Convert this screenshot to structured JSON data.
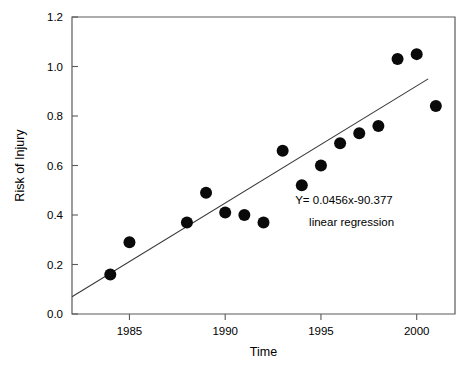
{
  "chart_data": {
    "type": "scatter",
    "title": "",
    "xlabel": "Time",
    "ylabel": "Risk of Injury",
    "xlim": [
      1982,
      2002
    ],
    "ylim": [
      0.0,
      1.2
    ],
    "grid": false,
    "legend": null,
    "x_ticks": [
      1985,
      1990,
      1995,
      2000
    ],
    "x_tick_labels": [
      "1985",
      "1990",
      "1995",
      "2000"
    ],
    "y_ticks": [
      0.0,
      0.2,
      0.4,
      0.6,
      0.8,
      1.0,
      1.2
    ],
    "y_tick_labels": [
      "0.0",
      "0.2",
      "0.4",
      "0.6",
      "0.8",
      "1.0",
      "1.2"
    ],
    "x": [
      1984,
      1985,
      1988,
      1989,
      1990,
      1991,
      1992,
      1993,
      1994,
      1995,
      1996,
      1997,
      1998,
      1999,
      2000,
      2001
    ],
    "y": [
      0.16,
      0.29,
      0.37,
      0.49,
      0.41,
      0.4,
      0.37,
      0.66,
      0.52,
      0.6,
      0.69,
      0.73,
      0.76,
      1.03,
      1.05,
      0.84
    ],
    "points": [
      {
        "x": 1984,
        "y": 0.16
      },
      {
        "x": 1985,
        "y": 0.29
      },
      {
        "x": 1988,
        "y": 0.37
      },
      {
        "x": 1989,
        "y": 0.49
      },
      {
        "x": 1990,
        "y": 0.41
      },
      {
        "x": 1991,
        "y": 0.4
      },
      {
        "x": 1992,
        "y": 0.37
      },
      {
        "x": 1993,
        "y": 0.66
      },
      {
        "x": 1994,
        "y": 0.52
      },
      {
        "x": 1995,
        "y": 0.6
      },
      {
        "x": 1996,
        "y": 0.69
      },
      {
        "x": 1997,
        "y": 0.73
      },
      {
        "x": 1998,
        "y": 0.76
      },
      {
        "x": 1999,
        "y": 1.03
      },
      {
        "x": 2000,
        "y": 1.05
      },
      {
        "x": 2001,
        "y": 0.84
      }
    ],
    "trendline": {
      "type": "line",
      "slope": 0.0456,
      "intercept": -90.377,
      "x_start": 1982,
      "x_end": 2000.6,
      "y_start": 0.07,
      "y_end": 0.95
    },
    "annotations": [
      {
        "text": "Y= 0.0456x-90.377",
        "x": 1996.2,
        "y": 0.445
      },
      {
        "text": "linear regression",
        "x": 1996.6,
        "y": 0.355
      }
    ],
    "marker": "filled-circle",
    "marker_size": 6,
    "series_color": "#0a0a0a",
    "line_color": "#3a3a3a",
    "axis_color": "#5a5a5a",
    "background": "#ffffff"
  }
}
